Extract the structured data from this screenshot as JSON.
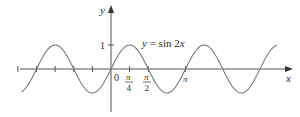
{
  "chart_data": {
    "type": "line",
    "title": "",
    "equation_label": "y = sin 2x",
    "equation_parts": {
      "lhs": "y",
      "eq": " = sin 2",
      "var": "x"
    },
    "xlabel": "x",
    "ylabel": "y",
    "origin_label": "0",
    "y_tick_label": "1",
    "x_tick_labels": [
      {
        "num": "π",
        "den": "4",
        "value": 0.7854
      },
      {
        "num": "π",
        "den": "2",
        "value": 1.5708
      },
      {
        "label": "π",
        "value": 3.1416
      }
    ],
    "x_ticks_radians": [
      -3.927,
      -3.1416,
      -2.3562,
      -1.5708,
      -0.7854,
      0,
      0.7854,
      1.5708,
      3.1416
    ],
    "xlim": [
      -4.8,
      7.4
    ],
    "ylim": [
      -1.75,
      2.6
    ],
    "series": [
      {
        "name": "y = sin 2x",
        "function": "sin(2x)",
        "x_range": [
          -3.77,
          7.0
        ],
        "amplitude": 1,
        "period": 3.1416,
        "zeros": [
          -3.1416,
          -1.5708,
          0,
          1.5708,
          3.1416,
          4.7124,
          6.2832
        ]
      }
    ],
    "grid": false,
    "legend": "none",
    "colors": {
      "curve": "#7a7a7a",
      "axes": "#555555",
      "text": "#2a2a2a"
    }
  }
}
